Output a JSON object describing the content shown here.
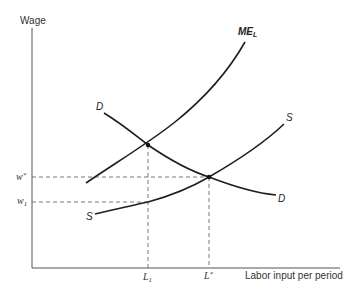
{
  "diagram": {
    "type": "monopsony labor market",
    "y_axis_label": "Wage",
    "x_axis_label": "Labor input per period",
    "curves": [
      {
        "name": "ME",
        "subscript": "L",
        "label": "ME_L",
        "description": "Marginal expenditure on labor"
      },
      {
        "name": "D",
        "label": "D",
        "description": "Demand for labor"
      },
      {
        "name": "S",
        "label": "S",
        "description": "Supply of labor"
      }
    ],
    "y_ticks": [
      {
        "name": "w",
        "sup": "*",
        "label": "w*"
      },
      {
        "name": "w",
        "sub": "1",
        "label": "w1"
      }
    ],
    "x_ticks": [
      {
        "name": "L",
        "sub": "1",
        "label": "L1"
      },
      {
        "name": "L",
        "sup": "*",
        "label": "L*"
      }
    ],
    "intersections": [
      {
        "curves": [
          "D",
          "ME_L"
        ],
        "x_tick": "L1"
      },
      {
        "curves": [
          "D",
          "S"
        ],
        "x_tick": "L*",
        "y_tick": "w*"
      }
    ]
  },
  "labels": {
    "wage": "Wage",
    "labor": "Labor input per period",
    "me_main": "ME",
    "me_sub": "L",
    "d_left": "D",
    "d_right": "D",
    "s_left": "S",
    "s_right": "S",
    "wstar_main": "w",
    "wstar_sup": "*",
    "w1_main": "w",
    "w1_sub": "1",
    "l1_main": "L",
    "l1_sub": "1",
    "lstar_main": "L",
    "lstar_sup": "*"
  },
  "colors": {
    "curve": "#1e1e1e",
    "axis": "#555555",
    "dashed": "#6a6a6a",
    "background": "#ffffff"
  }
}
